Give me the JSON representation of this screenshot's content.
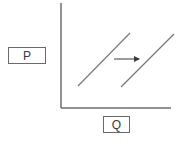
{
  "diagram": {
    "y_axis_label": "P",
    "x_axis_label": "Q",
    "colors": {
      "axis": "#6e6e6e",
      "curve": "#7a7a7a",
      "arrow": "#3a3a3a",
      "box_border": "#6a6a6a"
    },
    "curves": [
      {
        "name": "original-supply-curve",
        "x1": 78,
        "y1": 86,
        "x2": 130,
        "y2": 33
      },
      {
        "name": "shifted-supply-curve",
        "x1": 121,
        "y1": 87,
        "x2": 174,
        "y2": 34
      }
    ],
    "shift_arrow": {
      "direction": "right",
      "x1": 114,
      "y1": 59,
      "x2": 141,
      "y2": 59
    }
  }
}
